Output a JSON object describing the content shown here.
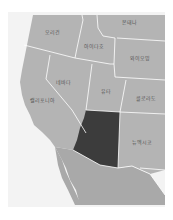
{
  "map": {
    "highlighted_state": "Arizona",
    "colors": {
      "background": "#ffffff",
      "ocean": "#f4f4f4",
      "land": "#b4b4b4",
      "mexico": "#a8a8a8",
      "highlight": "#3c3c3c",
      "border": "#ffffff"
    },
    "labels": [
      {
        "id": "oregon",
        "text": "오리건",
        "x": 52,
        "y": 31
      },
      {
        "id": "montana",
        "text": "몬태나",
        "x": 129,
        "y": 21
      },
      {
        "id": "idaho",
        "text": "아이다호",
        "x": 94,
        "y": 45
      },
      {
        "id": "wyoming",
        "text": "와이오밍",
        "x": 140,
        "y": 57
      },
      {
        "id": "nevada",
        "text": "네바다",
        "x": 63,
        "y": 81
      },
      {
        "id": "utah",
        "text": "유타",
        "x": 106,
        "y": 90
      },
      {
        "id": "colorado",
        "text": "콜로라도",
        "x": 146,
        "y": 97
      },
      {
        "id": "california",
        "text": "캘리포니아",
        "x": 42,
        "y": 99
      },
      {
        "id": "new_mexico",
        "text": "뉴멕시코",
        "x": 142,
        "y": 141
      }
    ]
  }
}
